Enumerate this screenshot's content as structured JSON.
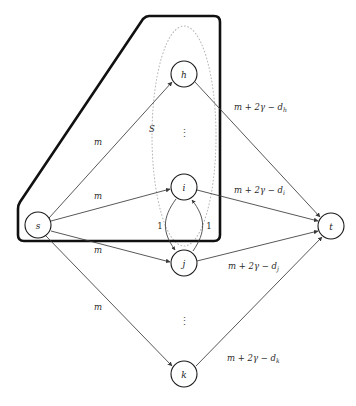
{
  "figure": {
    "kind": "flow-network-diagram",
    "background": "#ffffff",
    "edge_color": "#3a3a3a",
    "cut_color": "#111111",
    "set_color": "#b9b9b9"
  },
  "nodes": [
    {
      "id": "s",
      "label": "s",
      "cx": 38,
      "cy": 225,
      "r": 13
    },
    {
      "id": "h",
      "label": "h",
      "cx": 184,
      "cy": 74,
      "r": 13
    },
    {
      "id": "i",
      "label": "i",
      "cx": 184,
      "cy": 187,
      "r": 13
    },
    {
      "id": "j",
      "label": "j",
      "cx": 184,
      "cy": 263,
      "r": 13
    },
    {
      "id": "k",
      "label": "k",
      "cx": 184,
      "cy": 374,
      "r": 13
    },
    {
      "id": "t",
      "label": "t",
      "cx": 331,
      "cy": 226,
      "r": 13
    }
  ],
  "source_edge_label": "m",
  "sink_edge_labels": {
    "h": "m + 2γ − d",
    "i": "m + 2γ − d",
    "j": "m + 2γ − d",
    "k": "m + 2γ − d"
  },
  "sink_edge_subscripts": {
    "h": "h",
    "i": "i",
    "j": "j",
    "k": "k"
  },
  "edges": [
    {
      "name": "s-to-h",
      "from": "s",
      "to": "h",
      "label": "m"
    },
    {
      "name": "s-to-i",
      "from": "s",
      "to": "i",
      "label": "m"
    },
    {
      "name": "s-to-j",
      "from": "s",
      "to": "j",
      "label": "m"
    },
    {
      "name": "s-to-k",
      "from": "s",
      "to": "k",
      "label": "m"
    },
    {
      "name": "h-to-t",
      "from": "h",
      "to": "t",
      "label": "m + 2γ − dₕ"
    },
    {
      "name": "i-to-t",
      "from": "i",
      "to": "t",
      "label": "m + 2γ − dᵢ"
    },
    {
      "name": "j-to-t",
      "from": "j",
      "to": "t",
      "label": "m + 2γ − dⱼ"
    },
    {
      "name": "k-to-t",
      "from": "k",
      "to": "t",
      "label": "m + 2γ − dₖ"
    },
    {
      "name": "i-to-j",
      "from": "i",
      "to": "j",
      "label": "1"
    },
    {
      "name": "j-to-i",
      "from": "j",
      "to": "i",
      "label": "1"
    }
  ],
  "source_labels": [
    {
      "name": "m-label-h",
      "text": "m",
      "x": 98,
      "y": 142
    },
    {
      "name": "m-label-i",
      "text": "m",
      "x": 98,
      "y": 196
    },
    {
      "name": "m-label-j",
      "text": "m",
      "x": 98,
      "y": 250
    },
    {
      "name": "m-label-k",
      "text": "m",
      "x": 98,
      "y": 307
    }
  ],
  "unit_labels": [
    {
      "name": "unit-label-left",
      "text": "1",
      "x": 160,
      "y": 226
    },
    {
      "name": "unit-label-right",
      "text": "1",
      "x": 209,
      "y": 226
    }
  ],
  "set_label": {
    "name": "set-label-S",
    "text": "S",
    "x": 152,
    "y": 129
  },
  "ellipsis": [
    {
      "name": "ellipsis-upper",
      "text": "⋮",
      "x": 184,
      "y": 133
    },
    {
      "name": "ellipsis-lower",
      "text": "⋮",
      "x": 184,
      "y": 321
    }
  ]
}
